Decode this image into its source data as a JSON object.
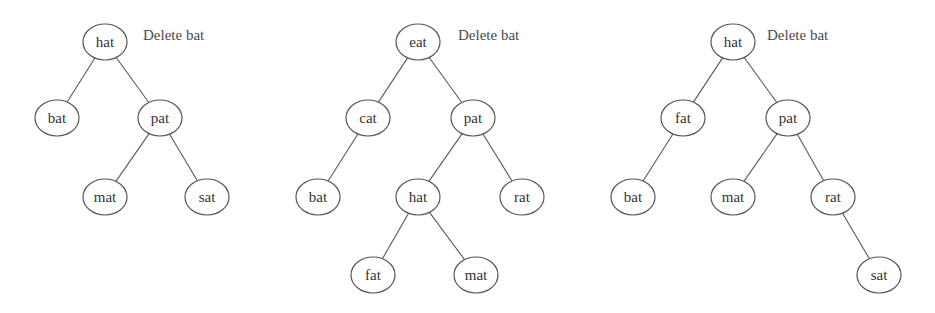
{
  "diagram": {
    "style": {
      "background": "#ffffff",
      "stroke": "#555555",
      "text": "#333333",
      "node_rx": 22,
      "node_ry": 18
    },
    "trees": [
      {
        "name": "tree-1",
        "caption": {
          "text": "Delete bat",
          "x": 143,
          "y": 40
        },
        "nodes": [
          {
            "id": "hat",
            "label": "hat",
            "x": 105,
            "y": 42
          },
          {
            "id": "bat",
            "label": "bat",
            "x": 57,
            "y": 118
          },
          {
            "id": "pat",
            "label": "pat",
            "x": 160,
            "y": 118
          },
          {
            "id": "mat",
            "label": "mat",
            "x": 105,
            "y": 197
          },
          {
            "id": "sat",
            "label": "sat",
            "x": 207,
            "y": 197
          }
        ],
        "edges": [
          [
            "hat",
            "bat"
          ],
          [
            "hat",
            "pat"
          ],
          [
            "pat",
            "mat"
          ],
          [
            "pat",
            "sat"
          ]
        ]
      },
      {
        "name": "tree-2",
        "caption": {
          "text": "Delete bat",
          "x": 458,
          "y": 40
        },
        "nodes": [
          {
            "id": "eat",
            "label": "eat",
            "x": 418,
            "y": 42
          },
          {
            "id": "cat",
            "label": "cat",
            "x": 368,
            "y": 118
          },
          {
            "id": "pat",
            "label": "pat",
            "x": 473,
            "y": 118
          },
          {
            "id": "bat",
            "label": "bat",
            "x": 318,
            "y": 197
          },
          {
            "id": "hat",
            "label": "hat",
            "x": 418,
            "y": 197
          },
          {
            "id": "rat",
            "label": "rat",
            "x": 522,
            "y": 197
          },
          {
            "id": "fat",
            "label": "fat",
            "x": 373,
            "y": 275
          },
          {
            "id": "mat",
            "label": "mat",
            "x": 476,
            "y": 275
          }
        ],
        "edges": [
          [
            "eat",
            "cat"
          ],
          [
            "eat",
            "pat"
          ],
          [
            "cat",
            "bat"
          ],
          [
            "pat",
            "hat"
          ],
          [
            "pat",
            "rat"
          ],
          [
            "hat",
            "fat"
          ],
          [
            "hat",
            "mat"
          ]
        ]
      },
      {
        "name": "tree-3",
        "caption": {
          "text": "Delete bat",
          "x": 767,
          "y": 40
        },
        "nodes": [
          {
            "id": "hat",
            "label": "hat",
            "x": 733,
            "y": 42
          },
          {
            "id": "fat",
            "label": "fat",
            "x": 683,
            "y": 118
          },
          {
            "id": "pat",
            "label": "pat",
            "x": 788,
            "y": 118
          },
          {
            "id": "bat",
            "label": "bat",
            "x": 633,
            "y": 197
          },
          {
            "id": "mat",
            "label": "mat",
            "x": 733,
            "y": 197
          },
          {
            "id": "rat",
            "label": "rat",
            "x": 833,
            "y": 197
          },
          {
            "id": "sat",
            "label": "sat",
            "x": 879,
            "y": 275
          }
        ],
        "edges": [
          [
            "hat",
            "fat"
          ],
          [
            "hat",
            "pat"
          ],
          [
            "fat",
            "bat"
          ],
          [
            "pat",
            "mat"
          ],
          [
            "pat",
            "rat"
          ],
          [
            "rat",
            "sat"
          ]
        ]
      }
    ]
  }
}
